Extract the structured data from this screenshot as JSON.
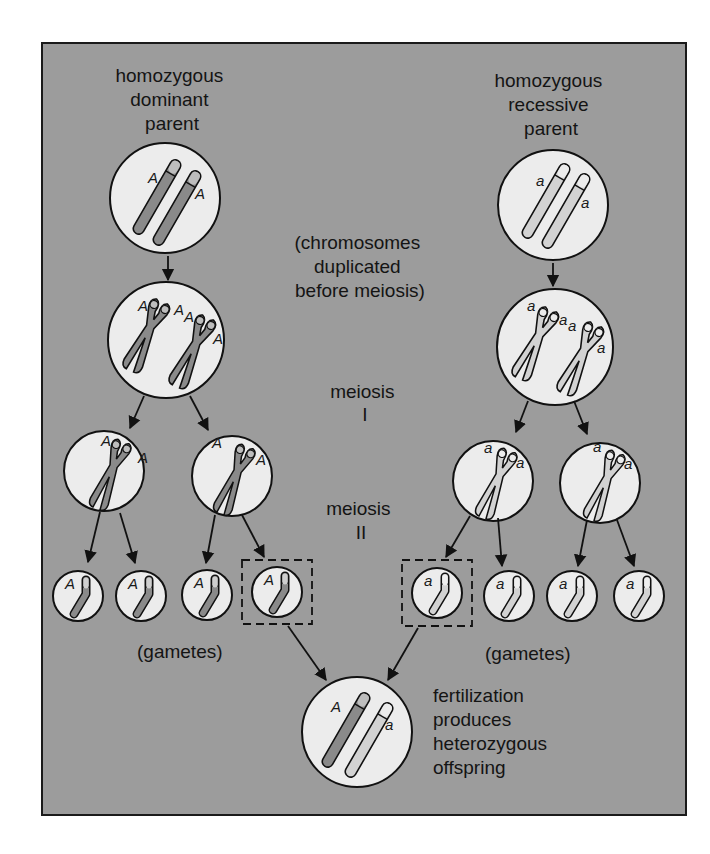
{
  "colors": {
    "panel": "#9c9c9c",
    "cell": "#ececec",
    "dominant_chromosome": "#8a8a8a",
    "recessive_chromosome": "#cfcfcf",
    "outline": "#111111"
  },
  "labels": {
    "left_parent": [
      "homozygous",
      "dominant",
      "parent"
    ],
    "right_parent": [
      "homozygous",
      "recessive",
      "parent"
    ],
    "duplication_note": [
      "(chromosomes",
      "duplicated",
      "before meiosis)"
    ],
    "meiosis_1": [
      "meiosis",
      "I"
    ],
    "meiosis_2": [
      "meiosis",
      "II"
    ],
    "gametes_left": "(gametes)",
    "gametes_right": "(gametes)",
    "fertilization": [
      "fertilization",
      "produces",
      "heterozygous",
      "offspring"
    ]
  },
  "alleles": {
    "dominant": "A",
    "recessive": "a"
  },
  "stages": {
    "left": {
      "parent": {
        "genotype": "AA",
        "chromosomes": 2
      },
      "duplicated": {
        "alleles_shown": [
          "A",
          "A",
          "A",
          "A"
        ]
      },
      "meiosis_1_cells": [
        {
          "alleles": [
            "A",
            "A"
          ]
        },
        {
          "alleles": [
            "A",
            "A"
          ]
        }
      ],
      "gametes": [
        {
          "allele": "A"
        },
        {
          "allele": "A"
        },
        {
          "allele": "A"
        },
        {
          "allele": "A",
          "highlighted": true
        }
      ]
    },
    "right": {
      "parent": {
        "genotype": "aa",
        "chromosomes": 2
      },
      "duplicated": {
        "alleles_shown": [
          "a",
          "a",
          "a",
          "a"
        ]
      },
      "meiosis_1_cells": [
        {
          "alleles": [
            "a",
            "a"
          ]
        },
        {
          "alleles": [
            "a",
            "a"
          ]
        }
      ],
      "gametes": [
        {
          "allele": "a",
          "highlighted": true
        },
        {
          "allele": "a"
        },
        {
          "allele": "a"
        },
        {
          "allele": "a"
        }
      ]
    },
    "offspring": {
      "genotype": "Aa",
      "alleles": [
        "A",
        "a"
      ]
    }
  }
}
